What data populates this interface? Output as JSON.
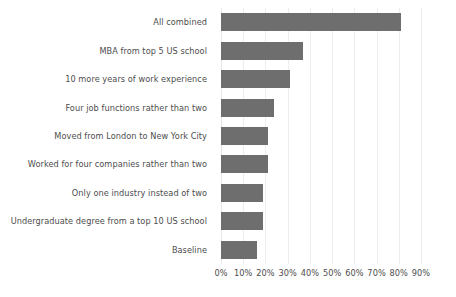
{
  "chart_data": {
    "type": "bar",
    "orientation": "horizontal",
    "title": "",
    "subtitle": "",
    "xlabel": "",
    "ylabel": "",
    "categories": [
      "All combined",
      "MBA from top 5 US school",
      "10 more years of work experience",
      "Four job functions rather than two",
      "Moved from London to New York City",
      "Worked for four companies rather than two",
      "Only one industry instead of two",
      "Undergraduate degree from a top 10 US school",
      "Baseline"
    ],
    "values": [
      81,
      37,
      31,
      24,
      21,
      21,
      19,
      19,
      16
    ],
    "value_unit": "%",
    "xlim": [
      0,
      90
    ],
    "xticks": [
      0,
      10,
      20,
      30,
      40,
      50,
      60,
      70,
      80,
      90
    ],
    "xtick_labels": [
      "0%",
      "10%",
      "20%",
      "30%",
      "40%",
      "50%",
      "60%",
      "70%",
      "80%",
      "90%"
    ],
    "grid": "vertical",
    "legend": "none",
    "bar_color": "#6e6e6e",
    "gridline_color": "#ededed",
    "text_color": "#4d4d4d",
    "background_color": "#ffffff"
  }
}
